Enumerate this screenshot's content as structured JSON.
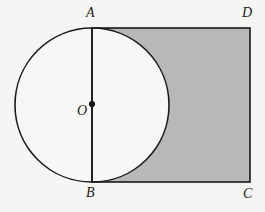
{
  "figure": {
    "name": "circle-inscribed-in-rectangle-shaded-region",
    "background_color": "#f5f5f3",
    "stroke_color": "#1a1a1a",
    "shade_color": "#b8b8b8",
    "unshaded_color": "#f7f7f5",
    "labels": {
      "A": "A",
      "B": "B",
      "C": "C",
      "D": "D",
      "O": "O"
    },
    "rectangle": {
      "name": "ABCD",
      "left": 92,
      "top": 28,
      "right": 250,
      "bottom": 182,
      "width": 158,
      "height": 154
    },
    "circle": {
      "center_label": "O",
      "cx": 92,
      "cy": 105,
      "r": 77,
      "diameter_segment": "AB"
    },
    "center_dot": {
      "cx": 92,
      "cy": 104,
      "r": 3
    },
    "shaded_region_description": "rectangle ABCD minus right half of circle O"
  }
}
